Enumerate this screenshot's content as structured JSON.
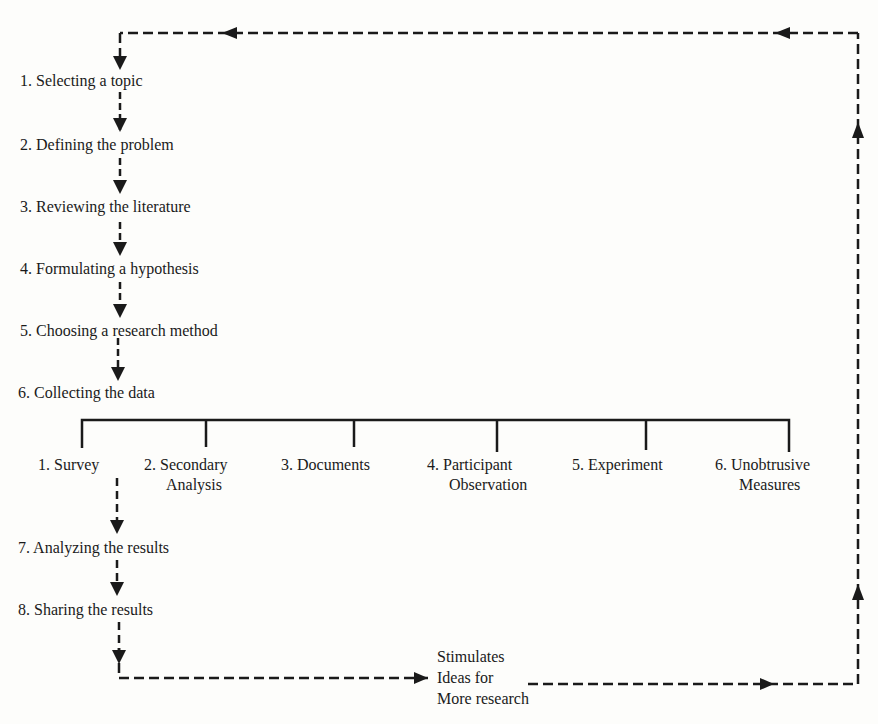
{
  "diagram": {
    "type": "flowchart",
    "steps": [
      {
        "label": "1. Selecting a topic"
      },
      {
        "label": "2. Defining the problem"
      },
      {
        "label": "3. Reviewing the literature"
      },
      {
        "label": "4. Formulating a hypothesis"
      },
      {
        "label": "5. Choosing a research method"
      },
      {
        "label": "6. Collecting the data"
      },
      {
        "label": "7. Analyzing the results"
      },
      {
        "label": "8. Sharing the results"
      }
    ],
    "methods": [
      {
        "line1": "1. Survey",
        "line2": ""
      },
      {
        "line1": "2. Secondary",
        "line2": "Analysis"
      },
      {
        "line1": "3. Documents",
        "line2": ""
      },
      {
        "line1": "4. Participant",
        "line2": "Observation"
      },
      {
        "line1": "5. Experiment",
        "line2": ""
      },
      {
        "line1": "6. Unobtrusive",
        "line2": "Measures"
      }
    ],
    "feedback": {
      "line1": "Stimulates",
      "line2": "Ideas for",
      "line3": "More research"
    },
    "line_color": "#1a1a1a"
  }
}
